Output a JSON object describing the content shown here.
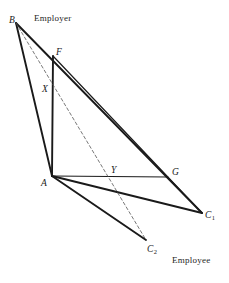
{
  "figure": {
    "title_role": "bargaining-set-geometry-diagram",
    "background_color": "#ffffff",
    "line_color": "#1a1a1a",
    "dash_color": "#555555",
    "solid_stroke_width": 1.9,
    "thin_stroke_width": 1.2,
    "dash_stroke_width": 0.8,
    "dash_pattern": "3,2.5",
    "width": 229,
    "height": 283
  },
  "vertices": [
    {
      "id": "B",
      "label": "B",
      "sub": "",
      "x": 16,
      "y": 23,
      "label_x": 9,
      "label_y": 16
    },
    {
      "id": "F",
      "label": "F",
      "sub": "",
      "x": 53,
      "y": 56,
      "label_x": 56,
      "label_y": 48
    },
    {
      "id": "X",
      "label": "X",
      "sub": "",
      "x": 52,
      "y": 89,
      "label_x": 42,
      "label_y": 85
    },
    {
      "id": "A",
      "label": "A",
      "sub": "",
      "x": 52,
      "y": 176,
      "label_x": 41,
      "label_y": 179
    },
    {
      "id": "Y",
      "label": "Y",
      "sub": "",
      "x": 115,
      "y": 177,
      "label_x": 111,
      "label_y": 166
    },
    {
      "id": "G",
      "label": "G",
      "sub": "",
      "x": 168,
      "y": 177,
      "label_x": 172,
      "label_y": 168
    },
    {
      "id": "C1",
      "label": "C",
      "sub": "1",
      "x": 202,
      "y": 213,
      "label_x": 205,
      "label_y": 211
    },
    {
      "id": "C2",
      "label": "C",
      "sub": "2",
      "x": 146,
      "y": 240,
      "label_x": 147,
      "label_y": 245
    }
  ],
  "edges": [
    {
      "id": "B-A",
      "from": "B",
      "to": "A",
      "style": "solid",
      "weight": "thick"
    },
    {
      "id": "B-C1",
      "from": "B",
      "to": "C1",
      "style": "solid",
      "weight": "thick"
    },
    {
      "id": "F-A",
      "from": "F",
      "to": "A",
      "style": "solid",
      "weight": "thick"
    },
    {
      "id": "F-C1",
      "from": "F",
      "to": "C1",
      "style": "solid",
      "weight": "thin"
    },
    {
      "id": "A-G",
      "from": "A",
      "to": "G",
      "style": "solid",
      "weight": "thin"
    },
    {
      "id": "A-C1",
      "from": "A",
      "to": "C1",
      "style": "solid",
      "weight": "thick"
    },
    {
      "id": "A-C2",
      "from": "A",
      "to": "C2",
      "style": "solid",
      "weight": "thick"
    },
    {
      "id": "B-C2",
      "from": "B",
      "to": "C2",
      "style": "dashed",
      "weight": "dash"
    }
  ],
  "annotations": [
    {
      "id": "employer",
      "text": "Employer",
      "x": 34,
      "y": 14
    },
    {
      "id": "employee",
      "text": "Employee",
      "x": 172,
      "y": 256
    }
  ]
}
